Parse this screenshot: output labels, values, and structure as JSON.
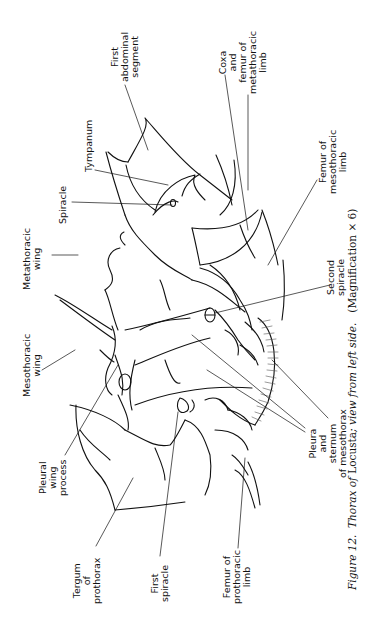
{
  "figure": {
    "number_label": "Figure 12.",
    "title_italic_1": "Thorax of",
    "title_roman": "Locusta",
    "title_italic_2": "; view from left side.",
    "magnification": "(Magnification × 6)",
    "orientation": "rotated 90° counter-clockwise",
    "labels": {
      "first_abdominal_segment": "First\nabdominal\nsegment",
      "coxa_femur_metathoracic": "Coxa\nand\nfemur of\nmetathoracic\nlimb",
      "tympanum": "Tympanum",
      "spiracle": "Spiracle",
      "metathoracic_wing": "Metathoracic\nwing",
      "femur_mesothoracic": "Femur of\nmesothoracic\nlimb",
      "second_spiracle": "Second\nspiracle",
      "mesothoracic_wing": "Mesothoracic\nwing",
      "pleural_wing_process": "Pleural\nwing\nprocess",
      "pleura_sternum_mesothorax": "Pleura\nand\nsternum\nof mesothorax",
      "tergum_prothorax": "Tergum\nof\nprothorax",
      "first_spiracle": "First\nspiracle",
      "femur_prothoracic": "Femur of\nprothoracic\nlimb"
    }
  }
}
